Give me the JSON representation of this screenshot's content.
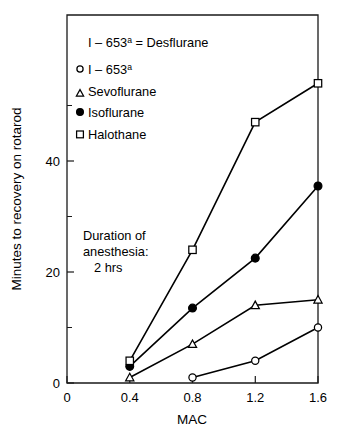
{
  "chart_data": {
    "type": "line",
    "title": "",
    "subtitle": "",
    "xlabel": "MAC",
    "ylabel": "Minutes to recovery on rotarod",
    "x": [
      0.4,
      0.8,
      1.2,
      1.6
    ],
    "xlim": [
      0,
      1.75
    ],
    "ylim": [
      0,
      57
    ],
    "xticks": [
      "0",
      "0.4",
      "0.8",
      "1.2",
      "1.6"
    ],
    "xtick_values": [
      0,
      0.4,
      0.8,
      1.2,
      1.6
    ],
    "yticks": [
      "0",
      "20",
      "40"
    ],
    "ytick_values": [
      0,
      20,
      40
    ],
    "yminor_values": [
      10,
      30,
      50
    ],
    "grid": false,
    "legend_position": "upper-left-inside",
    "series": [
      {
        "name": "I – 653",
        "name_sup": "a",
        "marker": "open-circle",
        "x": [
          0.8,
          1.2,
          1.6
        ],
        "values": [
          1,
          4,
          10
        ]
      },
      {
        "name": "Sevoflurane",
        "name_sup": "",
        "marker": "open-triangle",
        "x": [
          0.4,
          0.8,
          1.2,
          1.6
        ],
        "values": [
          1,
          7,
          14,
          15
        ]
      },
      {
        "name": "Isoflurane",
        "name_sup": "",
        "marker": "filled-circle",
        "x": [
          0.4,
          0.8,
          1.2,
          1.6
        ],
        "values": [
          3,
          13.5,
          22.5,
          35.5
        ]
      },
      {
        "name": "Halothane",
        "name_sup": "",
        "marker": "open-square",
        "x": [
          0.4,
          0.8,
          1.2,
          1.6
        ],
        "values": [
          4,
          24,
          47,
          54
        ]
      }
    ],
    "annotations": [
      {
        "id": "legend-header",
        "text_main": "I – 653",
        "text_sup": "a",
        "text_tail": " = Desflurane"
      },
      {
        "id": "duration-note-line1",
        "text": "Duration of"
      },
      {
        "id": "duration-note-line2",
        "text": "anesthesia:"
      },
      {
        "id": "duration-note-line3",
        "text": "2 hrs"
      }
    ],
    "colors": {
      "axis": "#1a1a1a",
      "line": "#000000",
      "marker_fill_open": "#ffffff",
      "marker_fill_solid": "#000000",
      "background": "#ffffff"
    }
  }
}
